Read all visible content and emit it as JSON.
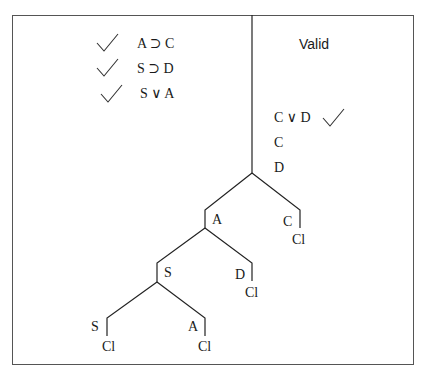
{
  "verdict": "Valid",
  "premises": [
    {
      "formula": "A ⊃ C",
      "checked": true
    },
    {
      "formula": "S ⊃ D",
      "checked": true
    },
    {
      "formula": "S ∨ A",
      "checked": true
    }
  ],
  "trunk": [
    {
      "formula": "C ∨ D",
      "checked": true
    },
    {
      "formula": "C"
    },
    {
      "formula": "D"
    }
  ],
  "branches": {
    "left_node": "A",
    "right_node": "C",
    "right_close": "Cl",
    "left_left_node": "S",
    "left_right_node": "D",
    "left_right_close": "Cl",
    "lll_node": "S",
    "lll_close": "Cl",
    "llr_node": "A",
    "llr_close": "Cl"
  },
  "colors": {
    "ink": "#1a1a1a",
    "frame": "#555555",
    "background": "#ffffff"
  }
}
